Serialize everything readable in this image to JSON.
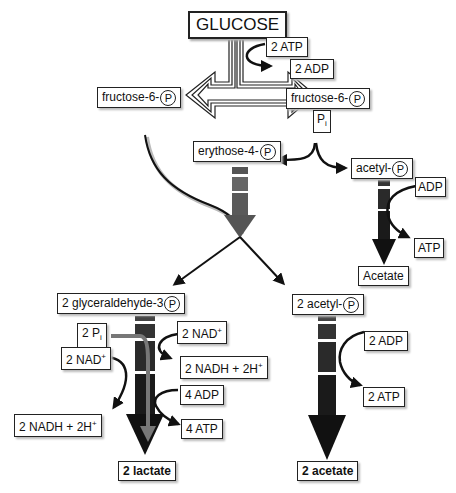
{
  "nodes": {
    "glucose": "GLUCOSE",
    "atp_in": "2 ATP",
    "adp_out": "2 ADP",
    "f6p_left": "fructose-6-",
    "f6p_right": "fructose-6-",
    "pi_box": "P",
    "pi_sub": "i",
    "erythrose": "erythose-4-",
    "acetyl_p": "acetyl-",
    "adp_small": "ADP",
    "atp_small": "ATP",
    "acetate": "Acetate",
    "g3p": "2 glyceraldehyde-3",
    "two_pi": "2 P",
    "two_pi_sub": "i",
    "nad_right": "2 NAD",
    "nadh_right": "2 NADH + 2H",
    "nad_left": "2 NAD",
    "nadh_left": "2 NADH + 2H",
    "adp4": "4 ADP",
    "atp4": "4 ATP",
    "lactate": "2 lactate",
    "acetyl2": "2 acetyl-",
    "adp2": "2 ADP",
    "atp2": "2 ATP",
    "acetate2": "2 acetate"
  },
  "symbols": {
    "phosphate": "P",
    "plus": "+"
  },
  "colors": {
    "line": "#111111",
    "arrow_dark": "#1a1a1a",
    "arrow_mid": "#555555",
    "arrow_grey": "#6e6e6e",
    "shadow": "#bbbbbb"
  }
}
